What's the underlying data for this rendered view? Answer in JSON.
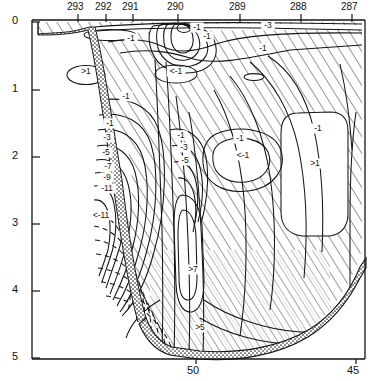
{
  "figure": {
    "type": "oceanographic-section-contour",
    "background": "#ffffff",
    "line_color": "#111111"
  },
  "axes": {
    "top": {
      "name": "station-numbers",
      "ticks": [
        {
          "label": "293",
          "x": 78
        },
        {
          "label": "292",
          "x": 106
        },
        {
          "label": "291",
          "x": 133
        },
        {
          "label": "290",
          "x": 178
        },
        {
          "label": "289",
          "x": 240
        },
        {
          "label": "288",
          "x": 301
        },
        {
          "label": "287",
          "x": 352
        }
      ]
    },
    "left": {
      "name": "depth-axis",
      "ticks": [
        {
          "label": "0",
          "y": 22
        },
        {
          "label": "1",
          "y": 90
        },
        {
          "label": "2",
          "y": 157
        },
        {
          "label": "3",
          "y": 224
        },
        {
          "label": "4",
          "y": 291
        },
        {
          "label": "5",
          "y": 358
        }
      ],
      "range": [
        0,
        5
      ]
    },
    "bottom": {
      "name": "latitude-axis",
      "ticks": [
        {
          "label": "50",
          "x": 196
        },
        {
          "label": "45",
          "x": 356
        }
      ]
    }
  },
  "contour_labels": [
    {
      "text": "-1",
      "x": 131,
      "y": 41
    },
    {
      "text": "-3",
      "x": 268,
      "y": 28
    },
    {
      "text": "-1",
      "x": 263,
      "y": 51
    },
    {
      "text": "-1",
      "x": 207,
      "y": 39
    },
    {
      "text": "-1",
      "x": 197,
      "y": 30
    },
    {
      "text": ">1",
      "x": 86,
      "y": 74
    },
    {
      "text": "<-1",
      "x": 176,
      "y": 74
    },
    {
      "text": "-1",
      "x": 126,
      "y": 99
    },
    {
      "text": "-1",
      "x": 110,
      "y": 126
    },
    {
      "text": "-3",
      "x": 107,
      "y": 140
    },
    {
      "text": "-5",
      "x": 106,
      "y": 155
    },
    {
      "text": "-7",
      "x": 108,
      "y": 169
    },
    {
      "text": "-9",
      "x": 107,
      "y": 180
    },
    {
      "text": "-11",
      "x": 107,
      "y": 191
    },
    {
      "text": "<-11",
      "x": 101,
      "y": 218
    },
    {
      "text": "-1",
      "x": 181,
      "y": 138
    },
    {
      "text": "-3",
      "x": 184,
      "y": 150
    },
    {
      "text": "-5",
      "x": 185,
      "y": 163
    },
    {
      "text": "-1",
      "x": 240,
      "y": 141
    },
    {
      "text": "<-1",
      "x": 243,
      "y": 158
    },
    {
      "text": "-1",
      "x": 318,
      "y": 131
    },
    {
      "text": ">1",
      "x": 315,
      "y": 166
    },
    {
      "text": ">7",
      "x": 193,
      "y": 272
    },
    {
      "text": ">5",
      "x": 200,
      "y": 330
    }
  ],
  "features": {
    "hatched_region": "diagonal-hachure-fill",
    "seafloor": "stippled-bathymetry",
    "dashed_contours": "lower-left-negative-core",
    "closed_cells": [
      {
        "name": "cell->1-upper-left",
        "label": ">1"
      },
      {
        "name": "cell-<-1-upper-center",
        "label": "<-1"
      },
      {
        "name": "cell-tiny-upper-right",
        "label": ""
      },
      {
        "name": "cell-<-1-mid-center",
        "label": "<-1"
      },
      {
        "name": "cell->1-right",
        "label": ">1"
      },
      {
        "name": "cell-<-11-core",
        "label": "<-11"
      }
    ]
  },
  "chart_data": {
    "type": "contour",
    "title": "",
    "xlabel": "",
    "ylabel": "",
    "top_axis_label": "",
    "station_numbers": [
      293,
      292,
      291,
      290,
      289,
      288,
      287
    ],
    "depth_ticks": [
      0,
      1,
      2,
      3,
      4,
      5
    ],
    "latitude_ticks": [
      50,
      45
    ],
    "contour_levels": [
      -11,
      -9,
      -7,
      -5,
      -3,
      -1,
      1,
      3,
      5,
      7
    ],
    "contour_label_texts": [
      "-1",
      "-3",
      "-5",
      "-7",
      "-9",
      "-11",
      "<-11",
      "<-1",
      ">1",
      ">5",
      ">7",
      "1",
      "3",
      "5"
    ],
    "ylim": [
      0,
      5
    ],
    "yinvert": true,
    "grid": false,
    "legend": "none"
  }
}
